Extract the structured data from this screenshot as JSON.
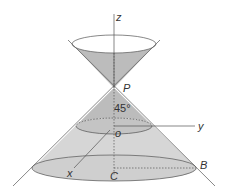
{
  "diagram": {
    "type": "double cone with coordinate axes",
    "labels": {
      "z_axis": "z",
      "y_axis": "y",
      "x_axis": "x",
      "apex": "P",
      "origin": "o",
      "angle": "45°",
      "base_center": "C",
      "base_point": "B"
    },
    "colors": {
      "cone_fill": "#bdbdbd",
      "cone_light": "#d9d9d9",
      "stroke": "#444444"
    }
  }
}
